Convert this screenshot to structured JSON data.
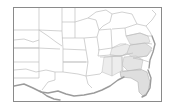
{
  "figure": {
    "name": "us-states-thumbnail-map",
    "width": 175,
    "height": 112
  },
  "frame": {
    "name": "map-border",
    "x": 13,
    "y": 7,
    "width": 149,
    "height": 95,
    "stroke": "#8a8a8a",
    "stroke_width": 1,
    "fill": "#ffffff"
  },
  "style": {
    "land_fill": "#ffffff",
    "state_border": "#b9b9b9",
    "coast_line": "#8f8f8f",
    "highlight_fill": "#e2e2e2",
    "highlight_fill_light": "#ededed",
    "water_shadow": "#9b9b9b",
    "background": "#ffffff"
  },
  "legend": {
    "visible": false,
    "entries": []
  },
  "labels": {
    "visible": false,
    "items": []
  },
  "regions": [
    {
      "id": "great-plains-north",
      "label": "",
      "highlighted": false
    },
    {
      "id": "great-plains-central",
      "label": "",
      "highlighted": false
    },
    {
      "id": "texas",
      "label": "",
      "highlighted": false
    },
    {
      "id": "midwest",
      "label": "",
      "highlighted": false
    },
    {
      "id": "great-lakes",
      "label": "",
      "highlighted": false
    },
    {
      "id": "appalachia",
      "label": "",
      "highlighted": true
    },
    {
      "id": "carolinas",
      "label": "",
      "highlighted": true
    },
    {
      "id": "georgia",
      "label": "",
      "highlighted": true
    },
    {
      "id": "florida",
      "label": "",
      "highlighted": true
    },
    {
      "id": "gulf-coast",
      "label": "",
      "highlighted": true
    },
    {
      "id": "mid-atlantic",
      "label": "",
      "highlighted": true
    }
  ]
}
